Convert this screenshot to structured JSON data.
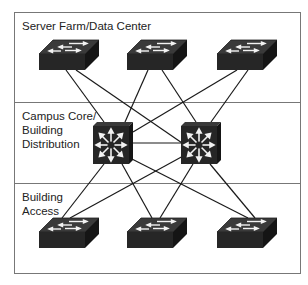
{
  "diagram": {
    "sections": [
      {
        "id": "server-farm",
        "label": "Server Farm/Data Center"
      },
      {
        "id": "campus-core",
        "label_lines": [
          "Campus Core/",
          "Building",
          "Distribution"
        ]
      },
      {
        "id": "building-access",
        "label_lines": [
          "Building",
          "Access"
        ]
      }
    ],
    "nodes": {
      "server_switches": [
        {
          "id": "sf1",
          "type": "workgroup-switch"
        },
        {
          "id": "sf2",
          "type": "workgroup-switch"
        },
        {
          "id": "sf3",
          "type": "workgroup-switch"
        }
      ],
      "core_switches": [
        {
          "id": "core1",
          "type": "multilayer-switch"
        },
        {
          "id": "core2",
          "type": "multilayer-switch"
        }
      ],
      "access_switches": [
        {
          "id": "ac1",
          "type": "workgroup-switch"
        },
        {
          "id": "ac2",
          "type": "workgroup-switch"
        },
        {
          "id": "ac3",
          "type": "workgroup-switch"
        }
      ]
    },
    "links": [
      [
        "sf1",
        "core1"
      ],
      [
        "sf1",
        "core2"
      ],
      [
        "sf2",
        "core1"
      ],
      [
        "sf2",
        "core2"
      ],
      [
        "sf3",
        "core1"
      ],
      [
        "sf3",
        "core2"
      ],
      [
        "core1",
        "core2"
      ],
      [
        "core1",
        "ac1"
      ],
      [
        "core1",
        "ac2"
      ],
      [
        "core1",
        "ac3"
      ],
      [
        "core2",
        "ac1"
      ],
      [
        "core2",
        "ac2"
      ],
      [
        "core2",
        "ac3"
      ]
    ],
    "colors": {
      "frame": "#777777",
      "device": "#2b2b2b",
      "link": "#1a1a1a"
    }
  }
}
